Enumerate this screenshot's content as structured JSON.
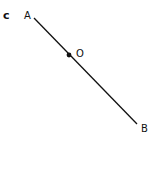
{
  "figure": {
    "panel_label": "c",
    "line_color": "#111111",
    "points": {
      "A": {
        "label": "A"
      },
      "O": {
        "label": "O"
      },
      "B": {
        "label": "B"
      }
    },
    "segment": {
      "from": "A",
      "to": "B",
      "midpoint": "O"
    }
  }
}
